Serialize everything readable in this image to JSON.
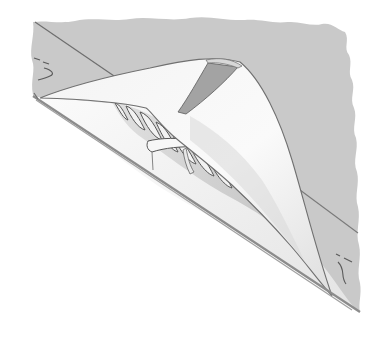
{
  "illustration": {
    "subject": "Sail corner with cloth flap folded back revealing twisted boltrope sewn along the edge",
    "colors": {
      "background": "#ffffff",
      "sail_grey": "#c9c9c9",
      "cloth_white": "#f7f7f7",
      "shadow_grey": "#9a9a9a",
      "line_dark": "#6e6e6e",
      "rope_light": "#f2f2f2",
      "rope_shadow": "#8a8a8a"
    },
    "elements": [
      "grey-sail-panel",
      "seam-line",
      "folded-cloth-flap",
      "boltrope",
      "binding-strap",
      "edge-double-line",
      "stitch-mark-top-left",
      "stitch-mark-bottom-right"
    ]
  }
}
